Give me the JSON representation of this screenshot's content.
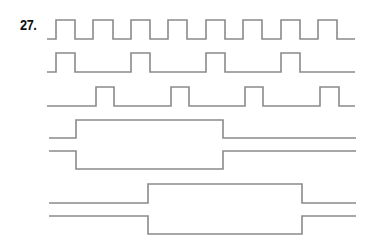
{
  "problem": {
    "number_label": "27."
  },
  "style": {
    "line_color": "#8a8a8a",
    "label_color": "#111111",
    "background": "#ffffff"
  },
  "waveforms": [
    {
      "name": "clock",
      "type": "pulse-train",
      "x_start": 47,
      "x_end": 355,
      "y_low": 39,
      "y_high": 20,
      "pulses": [
        [
          56,
          75
        ],
        [
          93,
          113
        ],
        [
          131,
          150
        ],
        [
          168,
          187
        ],
        [
          206,
          225
        ],
        [
          243,
          262
        ],
        [
          281,
          300
        ],
        [
          318,
          337
        ]
      ]
    },
    {
      "name": "divide-by-2",
      "type": "pulse-train",
      "x_start": 47,
      "x_end": 355,
      "y_low": 72,
      "y_high": 53,
      "pulses": [
        [
          56,
          75
        ],
        [
          131,
          150
        ],
        [
          206,
          225
        ],
        [
          281,
          300
        ]
      ]
    },
    {
      "name": "divide-by-2-delayed",
      "type": "pulse-train",
      "x_start": 47,
      "x_end": 355,
      "y_low": 106,
      "y_high": 87,
      "pulses": [
        [
          96,
          114
        ],
        [
          171,
          189
        ],
        [
          245,
          263
        ],
        [
          320,
          339
        ]
      ]
    },
    {
      "name": "bus-1",
      "type": "differential",
      "x_start": 49,
      "x_end": 356,
      "y_upper_idle": 138,
      "y_upper_active": 120,
      "y_lower_idle": 151,
      "y_lower_active": 169,
      "active": [
        76,
        223
      ]
    },
    {
      "name": "bus-2",
      "type": "differential",
      "x_start": 49,
      "x_end": 356,
      "y_upper_idle": 203,
      "y_upper_active": 184,
      "y_lower_idle": 216,
      "y_lower_active": 234,
      "active": [
        148,
        302
      ]
    }
  ]
}
